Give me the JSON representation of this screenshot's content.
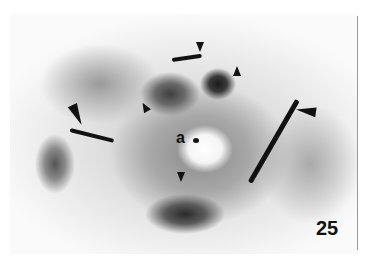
{
  "figure": {
    "panel_number": "25",
    "lumen_label": "a",
    "arrowheads": [
      {
        "id": "top-center",
        "x": 200,
        "y": 48,
        "direction": "down"
      },
      {
        "id": "top-right",
        "x": 237,
        "y": 72,
        "direction": "up"
      },
      {
        "id": "upper-left",
        "x": 144,
        "y": 108,
        "direction": "up-left"
      },
      {
        "id": "left",
        "x": 78,
        "y": 118,
        "direction": "down"
      },
      {
        "id": "right",
        "x": 305,
        "y": 112,
        "direction": "left"
      },
      {
        "id": "bottom-center",
        "x": 181,
        "y": 178,
        "direction": "down"
      }
    ],
    "colors": {
      "stain": "#111111",
      "background": "#ffffff"
    }
  }
}
